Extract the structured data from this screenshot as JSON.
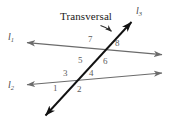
{
  "figure": {
    "title_label": "Transversal",
    "lines": [
      {
        "id": "l1",
        "label": "l",
        "subscript": "1",
        "role": "first-parallel-line",
        "color": "#6b6b6b"
      },
      {
        "id": "l2",
        "label": "l",
        "subscript": "2",
        "role": "second-parallel-line",
        "color": "#6b6b6b"
      },
      {
        "id": "l3",
        "label": "l",
        "subscript": "3",
        "role": "transversal-line",
        "color": "#1a1a1a"
      }
    ],
    "angles": [
      {
        "number": "1",
        "position": "below-left-of-lower-intersection"
      },
      {
        "number": "2",
        "position": "below-right-of-lower-intersection"
      },
      {
        "number": "3",
        "position": "above-left-of-lower-intersection"
      },
      {
        "number": "4",
        "position": "above-right-of-lower-intersection"
      },
      {
        "number": "5",
        "position": "below-left-of-upper-intersection"
      },
      {
        "number": "6",
        "position": "below-right-of-upper-intersection"
      },
      {
        "number": "7",
        "position": "above-left-of-upper-intersection"
      },
      {
        "number": "8",
        "position": "above-right-of-upper-intersection"
      }
    ],
    "colors": {
      "background": "#ffffff",
      "parallel_line": "#6b6b6b",
      "transversal_line": "#1a1a1a",
      "angle_number": "#5d5d5d",
      "line_label": "#4a4a4a",
      "callout_arrow": "#2b2b2b"
    }
  }
}
